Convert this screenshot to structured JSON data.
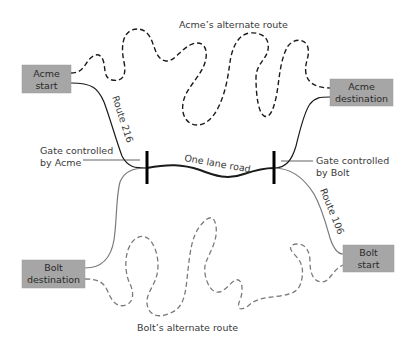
{
  "diagram": {
    "colors": {
      "box_fill": "#a6a6a6",
      "acme_route": "#1a1a1a",
      "bolt_route": "#7a7a7a",
      "gate": "#000000",
      "text": "#3a3a3a"
    },
    "nodes": {
      "acme_start": {
        "line1": "Acme",
        "line2": "start"
      },
      "acme_destination": {
        "line1": "Acme",
        "line2": "destination"
      },
      "bolt_destination": {
        "line1": "Bolt",
        "line2": "destination"
      },
      "bolt_start": {
        "line1": "Bolt",
        "line2": "start"
      }
    },
    "labels": {
      "acme_alternate_route": "Acme’s alternate route",
      "bolt_alternate_route": "Bolt’s alternate route",
      "route_216": "Route 216",
      "route_106": "Route 106",
      "one_lane_road": "One lane road",
      "gate_acme_line1": "Gate controlled",
      "gate_acme_line2": "by Acme",
      "gate_bolt_line1": "Gate controlled",
      "gate_bolt_line2": "by Bolt"
    }
  }
}
